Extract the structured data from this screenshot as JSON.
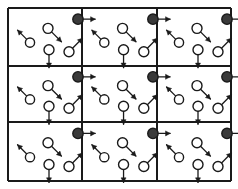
{
  "diagram": {
    "background_color": "#ffffff",
    "line_color": "#1a1a1a",
    "open_spin_fill": "#ffffff",
    "filled_spin_fill": "#3a3a3a",
    "frame": {
      "left": 8,
      "top": 8,
      "right": 231,
      "bottom": 181,
      "stroke_width": 1.6
    },
    "grid": {
      "columns": 3,
      "rows": 3,
      "x_lines": [
        8,
        82,
        157,
        231
      ],
      "y_lines": [
        8,
        66,
        122,
        181
      ],
      "stroke_width": 1.3
    },
    "cell": {
      "width": 74,
      "height": 57,
      "spins": [
        {
          "name": "spin-up-left",
          "type": "open",
          "cx": 22,
          "cy": 34,
          "r": 4.6,
          "angle_deg": 225,
          "arrow_length": 13,
          "label": "open circle, arrow up-left"
        },
        {
          "name": "spin-down-right",
          "type": "open",
          "cx": 40,
          "cy": 20,
          "r": 5.0,
          "angle_deg": 45,
          "arrow_length": 14,
          "label": "open circle, arrow down-right"
        },
        {
          "name": "spin-down",
          "type": "open",
          "cx": 41,
          "cy": 41,
          "r": 5.0,
          "angle_deg": 90,
          "arrow_length": 13,
          "label": "open circle, arrow straight down"
        },
        {
          "name": "spin-up-right",
          "type": "open",
          "cx": 61,
          "cy": 43,
          "r": 5.0,
          "angle_deg": 315,
          "arrow_length": 14,
          "label": "open circle, arrow up-right"
        },
        {
          "name": "spin-corner-right",
          "type": "filled",
          "cx": 70,
          "cy": 11,
          "r": 5.2,
          "angle_deg": 0,
          "arrow_length": 12,
          "label": "filled circle, arrow right, at top-right lattice corner"
        }
      ]
    }
  }
}
